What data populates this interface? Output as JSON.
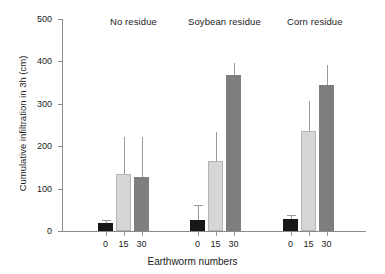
{
  "chart_data": {
    "type": "bar",
    "title": "",
    "xlabel": "Earthworm numbers",
    "ylabel": "Cumulative infiltration in 3h (cm)",
    "ylim": [
      0,
      500
    ],
    "yticks": [
      0,
      100,
      200,
      300,
      400,
      500
    ],
    "grid": false,
    "legend": "none",
    "group_labels": [
      "No residue",
      "Soybean residue",
      "Corn residue"
    ],
    "categories": [
      "0",
      "15",
      "30"
    ],
    "series": [
      {
        "name": "No residue",
        "values": [
          20,
          135,
          128
        ],
        "errors": [
          6,
          87,
          94
        ],
        "colors": [
          "#171717",
          "#d6d6d6",
          "#7e7e7e"
        ]
      },
      {
        "name": "Soybean residue",
        "values": [
          26,
          165,
          367
        ],
        "errors": [
          36,
          69,
          30
        ],
        "colors": [
          "#171717",
          "#d6d6d6",
          "#7e7e7e"
        ]
      },
      {
        "name": "Corn residue",
        "values": [
          29,
          235,
          345
        ],
        "errors": [
          9,
          72,
          47
        ],
        "colors": [
          "#171717",
          "#d6d6d6",
          "#7e7e7e"
        ]
      }
    ],
    "colors": {
      "bar_zero": "#171717",
      "bar_fifteen": "#d6d6d6",
      "bar_thirty": "#7e7e7e",
      "axis": "#8a8a8a",
      "text": "#1b1b1b",
      "background": "#ffffff"
    }
  },
  "axis": {
    "y_tick_labels": [
      "0",
      "100",
      "200",
      "300",
      "400",
      "500"
    ],
    "x_tick_labels": [
      "0",
      "15",
      "30",
      "0",
      "15",
      "30",
      "0",
      "15",
      "30"
    ],
    "x_title": "Earthworm numbers",
    "y_title": "Cumulative infiltration in 3h (cm)"
  },
  "headers": {
    "group1": "No residue",
    "group2": "Soybean residue",
    "group3": "Corn residue"
  }
}
